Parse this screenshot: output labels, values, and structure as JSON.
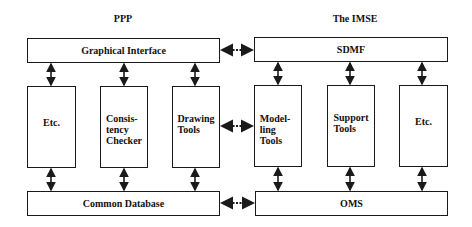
{
  "diagram": {
    "left_system": {
      "title": "PPP",
      "top_bar": "Graphical Interface",
      "columns": [
        "Etc.",
        "Consis-\ntency\nChecker",
        "Drawing\nTools"
      ],
      "bottom_bar": "Common Database"
    },
    "right_system": {
      "title": "The IMSE",
      "top_bar": "SDMF",
      "columns": [
        "Model-\nling\nTools",
        "Support\nTools",
        "Etc."
      ],
      "bottom_bar": "OMS"
    },
    "connections": [
      {
        "from": "Graphical Interface",
        "to": "SDMF",
        "style": "dotted-bidirectional"
      },
      {
        "from": "Drawing Tools",
        "to": "Modelling Tools",
        "style": "dotted-bidirectional"
      },
      {
        "from": "Common Database",
        "to": "OMS",
        "style": "dotted-bidirectional"
      }
    ],
    "colors": {
      "line": "#1a1a1a",
      "background": "#ffffff"
    }
  }
}
